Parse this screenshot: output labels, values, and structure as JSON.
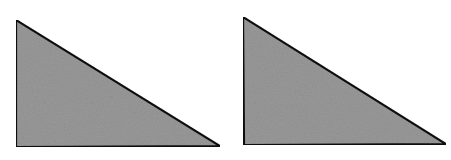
{
  "figure": {
    "background": "#ffffff",
    "fill_color": "#9a9a9a",
    "stroke_color": "#111111",
    "shapes": [
      {
        "name": "left-right-triangle",
        "points": "16,20 16,147 220,146"
      },
      {
        "name": "right-right-triangle",
        "points": "243,17 244,145 446,144"
      }
    ]
  }
}
